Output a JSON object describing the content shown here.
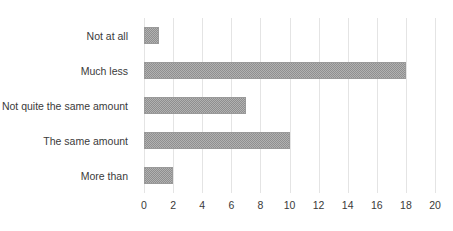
{
  "chart_data": {
    "type": "bar",
    "orientation": "horizontal",
    "title": "",
    "subtitle": "",
    "xlabel": "",
    "ylabel": "",
    "categories": [
      "Not at all",
      "Much less",
      "Not quite the same amount",
      "The same amount",
      "More than"
    ],
    "values": [
      1,
      18,
      7,
      10,
      2
    ],
    "series": [
      {
        "name": "",
        "values": [
          1,
          18,
          7,
          10,
          2
        ]
      }
    ],
    "xlim": [
      0,
      20
    ],
    "xticks": [
      0,
      2,
      4,
      6,
      8,
      10,
      12,
      14,
      16,
      18,
      20
    ],
    "xticklabels": [
      "0",
      "2",
      "4",
      "6",
      "8",
      "10",
      "12",
      "14",
      "16",
      "18",
      "20"
    ],
    "grid": {
      "vertical": true,
      "horizontal": false,
      "color": "#e4e4e4"
    },
    "legend": {
      "visible": false,
      "position": "none",
      "entries": []
    },
    "annotations": [],
    "colors": {
      "bar_fill": "#8f8f8f",
      "bar_border": "#9a9a9a",
      "gridline": "#e4e4e4",
      "text": "#3a3a3a",
      "background": "#ffffff"
    }
  }
}
